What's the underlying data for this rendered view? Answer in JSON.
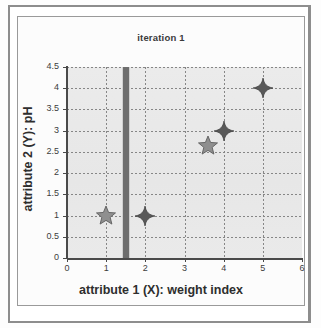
{
  "figure": {
    "title": "iteration 1"
  },
  "chart_data": {
    "type": "scatter",
    "title": "iteration 1",
    "xlabel": "attribute 1 (X): weight index",
    "ylabel": "attribute 2 (Y): pH",
    "xlim": [
      0,
      6
    ],
    "ylim": [
      0,
      4.5
    ],
    "xticks": [
      "0",
      "1",
      "2",
      "3",
      "4",
      "5",
      "6"
    ],
    "yticks": [
      "0",
      "0.5",
      "1",
      "1.5",
      "2",
      "2.5",
      "3",
      "3.5",
      "4",
      "4.5"
    ],
    "grid": true,
    "legend": null,
    "series": [
      {
        "name": "data points",
        "marker": "diamond",
        "color": "#595959",
        "points": [
          {
            "x": 2,
            "y": 1
          },
          {
            "x": 4,
            "y": 3
          },
          {
            "x": 5,
            "y": 4
          }
        ]
      },
      {
        "name": "centroids",
        "marker": "star",
        "color": "#8f8f8f",
        "points": [
          {
            "x": 1,
            "y": 1
          },
          {
            "x": 3.6,
            "y": 2.65
          }
        ]
      }
    ],
    "annotations": [
      {
        "type": "vertical-bar",
        "name": "split-line",
        "x": 1.5,
        "color": "#6e6e6e",
        "width_px": 6
      }
    ],
    "colors": {
      "plot_background": "#e9e9e9",
      "gridline": "#868686",
      "axis": "#4a4a4a",
      "diamond_marker": "#595959",
      "star_marker": "#8f8f8f",
      "split_bar": "#6e6e6e",
      "frame": "#8d8d8d"
    }
  }
}
